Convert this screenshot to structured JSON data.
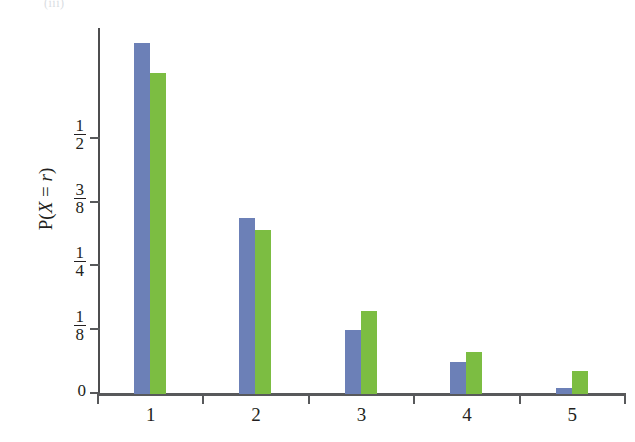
{
  "top_caption": "(iii)",
  "chart_data": {
    "type": "bar",
    "title": "",
    "subtitle": "",
    "xlabel": "",
    "ylabel": "P(X = r)",
    "ylabel_parts": {
      "p": "P(",
      "x": "X",
      "eq": " = ",
      "r": "r",
      "close": ")"
    },
    "categories": [
      "1",
      "2",
      "3",
      "4",
      "5"
    ],
    "x_tick_labels": [
      "1",
      "2",
      "3",
      "4",
      "5"
    ],
    "y_tick_labels": [
      "0",
      "1/8",
      "1/4",
      "3/8",
      "1/2"
    ],
    "y_tick_fractions": [
      {
        "label": "0",
        "numerator": "0",
        "denominator": "",
        "value": 0
      },
      {
        "label": "1/8",
        "numerator": "1",
        "denominator": "8",
        "value": 0.125
      },
      {
        "label": "1/4",
        "numerator": "1",
        "denominator": "4",
        "value": 0.25
      },
      {
        "label": "3/8",
        "numerator": "3",
        "denominator": "8",
        "value": 0.375
      },
      {
        "label": "1/2",
        "numerator": "1",
        "denominator": "2",
        "value": 0.5
      }
    ],
    "ylim": [
      0,
      0.715
    ],
    "xlim": [
      0.5,
      5.5
    ],
    "grid": false,
    "legend": false,
    "legend_position": "none",
    "series": [
      {
        "name": "series-blue",
        "color": "#6c80b7",
        "values": [
          0.688,
          0.344,
          0.125,
          0.063,
          0.012
        ]
      },
      {
        "name": "series-green",
        "color": "#7cbd42",
        "values": [
          0.629,
          0.322,
          0.162,
          0.082,
          0.045
        ]
      }
    ],
    "colors": {
      "blue": "#6c80b7",
      "green": "#7cbd42",
      "axis": "#58595b",
      "text": "#231f20"
    }
  }
}
